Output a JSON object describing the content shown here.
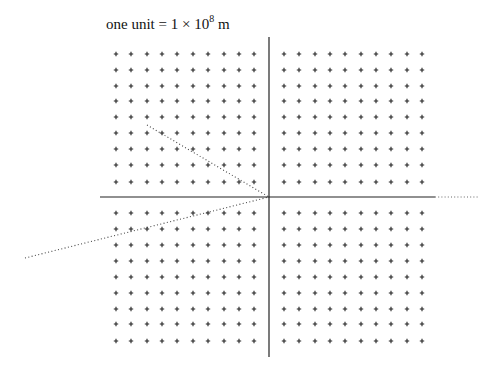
{
  "caption": {
    "prefix": "one unit = 1 × 10",
    "exponent": "8",
    "suffix": " m"
  },
  "axes": {
    "origin": [
      269,
      197
    ],
    "vertical": {
      "y1": 37,
      "y2": 357
    },
    "horizontal": {
      "x1": 100,
      "x2": 435
    },
    "horizontal_dotted_extension": {
      "x1": 435,
      "x2": 478
    },
    "color": "#222222"
  },
  "grid": {
    "columns_left": [
      116,
      131,
      147,
      162,
      177,
      193,
      208,
      224,
      239,
      254
    ],
    "columns_right": [
      284,
      299,
      315,
      330,
      345,
      361,
      376,
      391,
      407,
      422
    ],
    "rows_top": [
      54,
      70,
      86,
      101,
      117,
      133,
      149,
      165,
      182
    ],
    "rows_bottom": [
      213,
      229,
      245,
      261,
      277,
      293,
      309,
      324,
      341
    ],
    "marker": "+",
    "color": "#222222"
  },
  "vectors": [
    {
      "name": "upper-left-dotted-vector",
      "from": [
        147,
        125
      ],
      "to": [
        269,
        197
      ]
    },
    {
      "name": "lower-left-dotted-vector",
      "from": [
        25,
        258
      ],
      "to": [
        269,
        197
      ]
    }
  ]
}
